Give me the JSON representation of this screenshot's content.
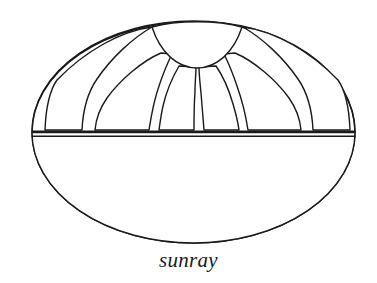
{
  "figure": {
    "name": "sunray-quilt-block-diagram",
    "caption": "sunray",
    "stroke_color": "#1a1a1a",
    "fill_color": "#ffffff",
    "background_color": "#ffffff",
    "stroke_width": 1.4,
    "outer_ellipse": {
      "cx": 193.5,
      "cy": 132.5,
      "rx": 161.5,
      "ry": 110.5
    },
    "horizontal_divider": {
      "y_top": 131.5,
      "y_bottom": 136.5,
      "x_left": 32,
      "x_right": 355
    },
    "center_dome": {
      "cx": 197,
      "cy": 24,
      "rx": 46,
      "ry": 44
    },
    "ray_count": 6,
    "ray_label": "sun ray wedge",
    "ray_wedges": [
      {
        "id": "ray-1",
        "top_x": 152,
        "top_y": 27,
        "inner_left": 57,
        "inner_right": 82,
        "bottom_y": 130
      },
      {
        "id": "ray-2",
        "top_x": 162,
        "top_y": 53,
        "inner_left": 99,
        "inner_right": 148,
        "bottom_y": 130
      },
      {
        "id": "ray-3",
        "top_x": 178,
        "top_y": 66,
        "inner_left": 168,
        "inner_right": 194,
        "bottom_y": 130
      },
      {
        "id": "ray-4",
        "top_x": 214,
        "top_y": 66,
        "inner_left": 200,
        "inner_right": 227,
        "bottom_y": 130
      },
      {
        "id": "ray-5",
        "top_x": 230,
        "top_y": 53,
        "inner_left": 247,
        "inner_right": 296,
        "bottom_y": 130
      },
      {
        "id": "ray-6",
        "top_x": 241,
        "top_y": 27,
        "inner_left": 313,
        "inner_right": 338,
        "bottom_y": 130
      }
    ]
  }
}
